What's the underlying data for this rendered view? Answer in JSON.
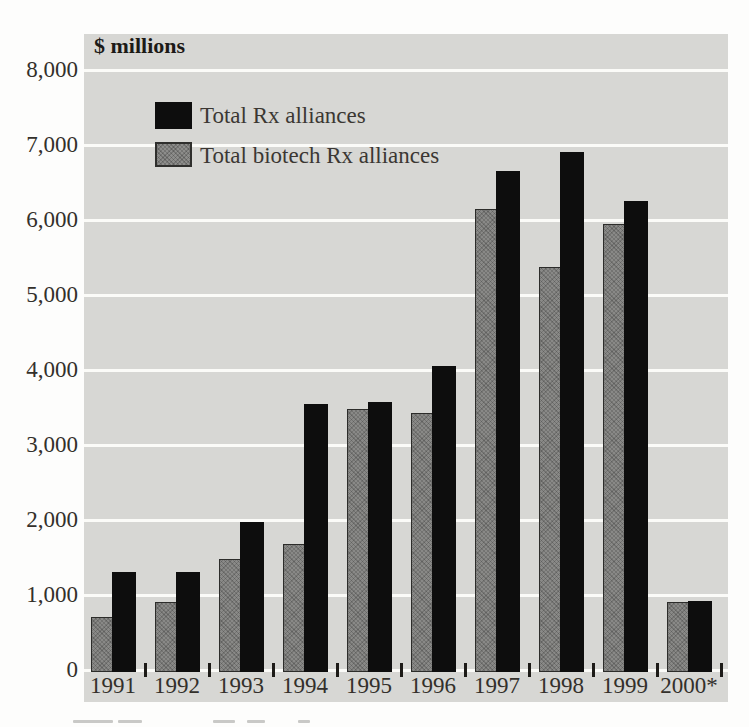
{
  "chart_data": {
    "type": "bar",
    "title": "$ millions",
    "categories": [
      "1991",
      "1992",
      "1993",
      "1994",
      "1995",
      "1996",
      "1997",
      "1998",
      "1999",
      "2000*"
    ],
    "series": [
      {
        "name": "Total Rx alliances",
        "color": "#0d0d0d",
        "values": [
          1300,
          1300,
          1975,
          3550,
          3575,
          4050,
          6650,
          6900,
          6250,
          925
        ]
      },
      {
        "name": "Total biotech Rx alliances",
        "color": "#898987",
        "values": [
          700,
          900,
          1475,
          1675,
          3475,
          3425,
          6150,
          5375,
          5950,
          900
        ]
      }
    ],
    "ylabel": "$ millions",
    "ylim": [
      0,
      8000
    ],
    "ytick_interval": 1000,
    "ytick_labels": [
      "8,000",
      "7,000",
      "6,000",
      "5,000",
      "4,000",
      "3,000",
      "2,000",
      "1,000",
      "0"
    ],
    "grid": "horizontal-white-on-gray",
    "legend_position": "inside-top-left",
    "plot_background": "#d7d7d4",
    "gridline_color": "#fbfbf8"
  },
  "colors": {
    "page_background": "#fdfdfc",
    "text": "#33302b",
    "bar_total": "#0d0d0d",
    "bar_biotech": "#898987"
  }
}
